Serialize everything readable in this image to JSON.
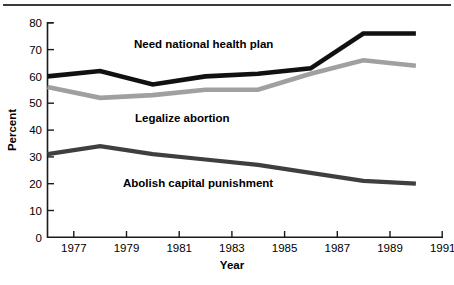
{
  "chart_data": {
    "type": "line",
    "title": "",
    "subtitle": "",
    "xlabel": "Year",
    "ylabel": "Percent",
    "xlim": [
      1976,
      1991
    ],
    "ylim": [
      0,
      80
    ],
    "xticks": [
      1977,
      1979,
      1981,
      1983,
      1985,
      1987,
      1989,
      1991
    ],
    "xticklabels": [
      "1977",
      "1979",
      "1981",
      "1983",
      "1985",
      "1987",
      "1989",
      "1991"
    ],
    "yticks": [
      0,
      10,
      20,
      30,
      40,
      50,
      60,
      70,
      80
    ],
    "yticklabels": [
      "0",
      "10",
      "20",
      "30",
      "40",
      "50",
      "60",
      "70",
      "80"
    ],
    "grid": false,
    "legend_position": "inline-annotations",
    "x": [
      1976,
      1978,
      1980,
      1982,
      1984,
      1986,
      1988,
      1990
    ],
    "series": [
      {
        "name": "Need national health plan",
        "color": "#111111",
        "values": [
          60,
          62,
          57,
          60,
          61,
          63,
          76,
          76
        ]
      },
      {
        "name": "Legalize abortion",
        "color": "#a0a0a0",
        "values": [
          56,
          52,
          53,
          55,
          55,
          61,
          66,
          64
        ]
      },
      {
        "name": "Abolish capital punishment",
        "color": "#3f3f3f",
        "values": [
          31,
          34,
          31,
          29,
          27,
          24,
          21,
          20
        ]
      }
    ],
    "annotations": [
      {
        "text": "Need national health plan",
        "x": 1981.1,
        "y": 69.5
      },
      {
        "text": "Legalize abortion",
        "x": 1981.0,
        "y": 45.0
      },
      {
        "text": "Abolish capital punishment",
        "x": 1981.3,
        "y": 20.0
      }
    ]
  },
  "axis": {
    "x_title": "Year",
    "y_title": "Percent"
  }
}
